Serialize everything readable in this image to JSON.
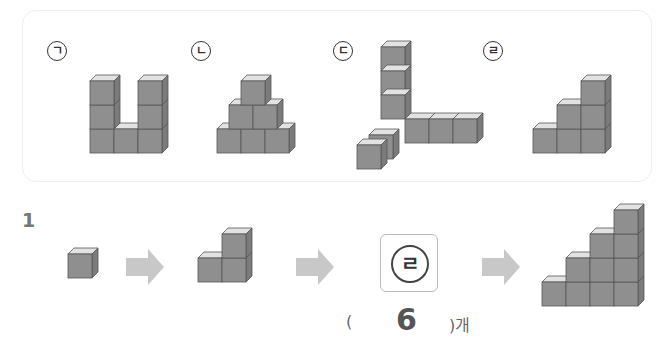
{
  "figures": [
    {
      "label": "ㄱ",
      "cube_count": 7
    },
    {
      "label": "ㄴ",
      "cube_count": 6
    },
    {
      "label": "ㄷ",
      "cube_count": 8
    },
    {
      "label": "ㄹ",
      "cube_count": 6
    }
  ],
  "question": {
    "number": "1",
    "sequence": [
      "1 cube",
      "3 cubes",
      "?",
      "10 cubes"
    ],
    "answer_label": "ㄹ",
    "answer": {
      "open_paren": "(",
      "value": "6",
      "close_paren": ")개"
    }
  },
  "colors": {
    "cube_front": "#8e8e8e",
    "cube_side": "#7a7a7a",
    "cube_top": "#e4e4e4",
    "arrow": "#c8c8c8"
  }
}
